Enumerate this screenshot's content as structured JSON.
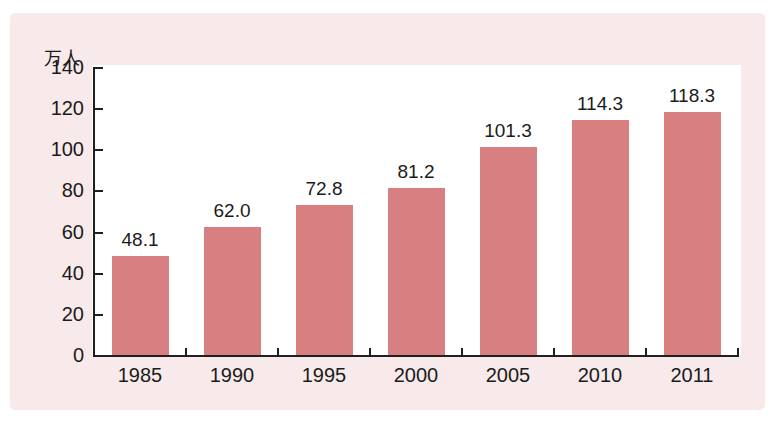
{
  "figure": {
    "background_color": "#f8eaea",
    "plot_background_color": "#ffffff",
    "bar_color": "#d88081",
    "axis_color": "#1f1f1f",
    "text_color": "#1b1b1b"
  },
  "chart_data": {
    "type": "bar",
    "title": "",
    "xlabel": "",
    "ylabel": "万人",
    "categories": [
      "1985",
      "1990",
      "1995",
      "2000",
      "2005",
      "2010",
      "2011"
    ],
    "values": [
      48.1,
      62.0,
      72.8,
      81.2,
      101.3,
      114.3,
      118.3
    ],
    "value_labels": [
      "48.1",
      "62.0",
      "72.8",
      "81.2",
      "101.3",
      "114.3",
      "118.3"
    ],
    "ylim": [
      0,
      140
    ],
    "yticks": [
      0,
      20,
      40,
      60,
      80,
      100,
      120,
      140
    ],
    "ytick_interval": 20,
    "grid": false,
    "legend": "none"
  }
}
